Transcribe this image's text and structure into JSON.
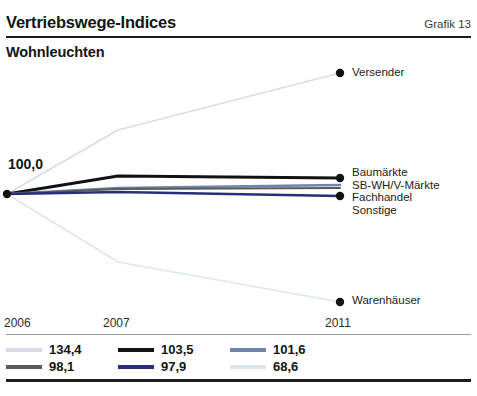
{
  "header": {
    "title": "Vertriebswege-Indices",
    "figure_number": "Grafik 13"
  },
  "subtitle": "Wohnleuchten",
  "base_label": "100,0",
  "chart_data": {
    "type": "line",
    "title": "Vertriebswege-Indices",
    "subtitle": "Wohnleuchten",
    "xlabel": "",
    "ylabel": "",
    "x": [
      "2006",
      "2007",
      "2011"
    ],
    "tick_labels": [
      "2006",
      "2007",
      "2011"
    ],
    "base_value": 100.0,
    "grid": false,
    "legend_position": "bottom",
    "series": [
      {
        "name": "Versender",
        "label": "Versender",
        "color": "#d6dde6",
        "end_value": "134,4",
        "values": [
          100.0,
          112.0,
          134.4
        ],
        "px": [
          [
            7,
            194
          ],
          [
            118,
            130
          ],
          [
            340,
            73
          ]
        ],
        "end_dot": true
      },
      {
        "name": "Baumärkte",
        "label": "Baumärkte",
        "color": "#121212",
        "end_value": "103,5",
        "values": [
          100.0,
          104.6,
          103.5
        ],
        "px": [
          [
            7,
            194
          ],
          [
            118,
            176
          ],
          [
            340,
            178
          ]
        ],
        "end_dot": true
      },
      {
        "name": "SB-WH/V-Märkte",
        "label": "SB-WH/V-Märkte",
        "color": "#6d86ae",
        "end_value": "101,6",
        "values": [
          100.0,
          101.0,
          101.6
        ],
        "px": [
          [
            7,
            194
          ],
          [
            118,
            188
          ],
          [
            340,
            185
          ]
        ],
        "end_dot": false
      },
      {
        "name": "Fachhandel",
        "label": "Fachhandel",
        "color": "#5a5a5a",
        "end_value": "98,1",
        "values": [
          100.0,
          99.2,
          98.1
        ],
        "px": [
          [
            7,
            194
          ],
          [
            118,
            189
          ],
          [
            340,
            188
          ]
        ],
        "end_dot": false
      },
      {
        "name": "Sonstige",
        "label": "Sonstige",
        "color": "#2a2d78",
        "end_value": "97,9",
        "values": [
          100.0,
          98.8,
          97.9
        ],
        "px": [
          [
            7,
            194
          ],
          [
            118,
            192
          ],
          [
            340,
            196
          ]
        ],
        "end_dot": true
      },
      {
        "name": "Warenhäuser",
        "label": "Warenhäuser",
        "color": "#dce6f2",
        "end_value": "68,6",
        "values": [
          100.0,
          84.0,
          68.6
        ],
        "px": [
          [
            7,
            194
          ],
          [
            118,
            262
          ],
          [
            340,
            302
          ]
        ],
        "end_dot": true
      }
    ],
    "point_labels": [
      {
        "label": "Versender",
        "at": "2011"
      },
      {
        "label": "Baumärkte",
        "at": "2011"
      },
      {
        "label": "SB-WH/V-Märkte",
        "at": "2011"
      },
      {
        "label": "Fachhandel",
        "at": "2011"
      },
      {
        "label": "Sonstige",
        "at": "2011"
      },
      {
        "label": "Warenhäuser",
        "at": "2011"
      }
    ],
    "legend": [
      {
        "value": "134,4",
        "color": "#d6dde6"
      },
      {
        "value": "103,5",
        "color": "#121212"
      },
      {
        "value": "101,6",
        "color": "#6d86ae"
      },
      {
        "value": "98,1",
        "color": "#5a5a5a"
      },
      {
        "value": "97,9",
        "color": "#2a2d78"
      },
      {
        "value": "68,6",
        "color": "#dde7f3"
      }
    ]
  },
  "source": ""
}
